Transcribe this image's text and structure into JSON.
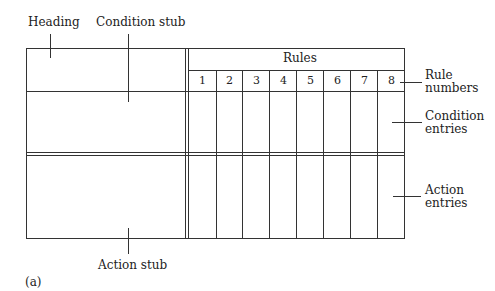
{
  "labels": {
    "heading": "Heading",
    "condition_stub": "Condition stub",
    "rules": "Rules",
    "rule_numbers_1": "Rule",
    "rule_numbers_2": "numbers",
    "condition_entries_1": "Condition",
    "condition_entries_2": "entries",
    "action_entries_1": "Action",
    "action_entries_2": "entries",
    "action_stub": "Action stub",
    "figure_tag": "(a)"
  },
  "rule_numbers": [
    "1",
    "2",
    "3",
    "4",
    "5",
    "6",
    "7",
    "8"
  ]
}
